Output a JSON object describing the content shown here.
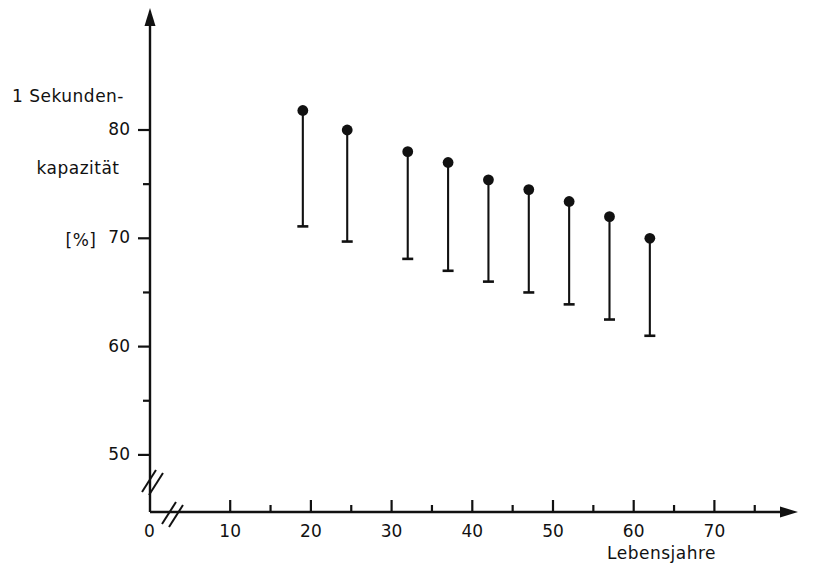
{
  "chart_data": {
    "type": "scatter",
    "title": "",
    "ylabel_lines": [
      "1 Sekunden-",
      "kapazität",
      "[%]"
    ],
    "ylabel": "1 Sekunden-kapazität [%]",
    "xlabel": "Lebensjahre",
    "xlim": [
      0,
      80
    ],
    "ylim": [
      48,
      84
    ],
    "grid": false,
    "legend": null,
    "x_axis_break": true,
    "y_axis_break": true,
    "x_ticks": [
      0,
      10,
      20,
      30,
      40,
      50,
      60,
      70
    ],
    "x_tick_labels": [
      "0",
      "10",
      "20",
      "30",
      "40",
      "50",
      "60",
      "70"
    ],
    "x_minor_ticks": [
      15,
      25,
      35,
      45,
      55,
      65,
      75
    ],
    "y_ticks": [
      50,
      60,
      70,
      80
    ],
    "y_tick_labels": [
      "50",
      "60",
      "70",
      "80"
    ],
    "y_minor_ticks": [
      55,
      65,
      75
    ],
    "marker": "filled-circle",
    "error_bar_direction": "down",
    "x": [
      19,
      24.5,
      32,
      37,
      42,
      47,
      52,
      57,
      62
    ],
    "values": [
      81.8,
      80.0,
      78.0,
      77.0,
      75.4,
      74.5,
      73.4,
      72.0,
      70.0
    ],
    "lower": [
      71.1,
      69.7,
      68.1,
      67.0,
      66.0,
      65.0,
      63.9,
      62.5,
      61.0
    ],
    "points": [
      {
        "x": 19,
        "y": 81.8,
        "low": 71.1
      },
      {
        "x": 24.5,
        "y": 80.0,
        "low": 69.7
      },
      {
        "x": 32,
        "y": 78.0,
        "low": 68.1
      },
      {
        "x": 37,
        "y": 77.0,
        "low": 67.0
      },
      {
        "x": 42,
        "y": 75.4,
        "low": 66.0
      },
      {
        "x": 47,
        "y": 74.5,
        "low": 65.0
      },
      {
        "x": 52,
        "y": 73.4,
        "low": 63.9
      },
      {
        "x": 57,
        "y": 72.0,
        "low": 62.5
      },
      {
        "x": 62,
        "y": 70.0,
        "low": 61.0
      }
    ],
    "colors": {
      "ink": "#111111",
      "background": "#ffffff"
    }
  }
}
